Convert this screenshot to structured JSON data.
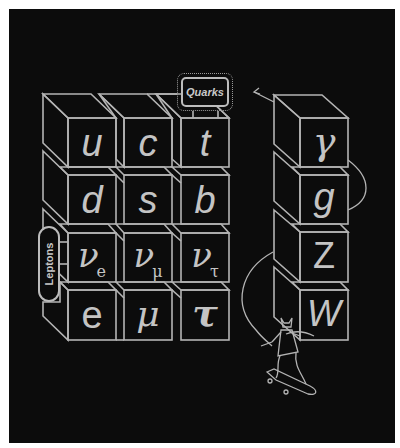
{
  "diagram": {
    "colors": {
      "background": "#0c0c0c",
      "stroke": "#b4b4b4",
      "text": "#c4c4c4",
      "page": "#ffffff"
    },
    "labels": {
      "quarks": "Quarks",
      "leptons": "Leptons"
    },
    "fermions": {
      "rows": [
        [
          {
            "symbol": "u",
            "sub": ""
          },
          {
            "symbol": "c",
            "sub": ""
          },
          {
            "symbol": "t",
            "sub": ""
          }
        ],
        [
          {
            "symbol": "d",
            "sub": ""
          },
          {
            "symbol": "s",
            "sub": ""
          },
          {
            "symbol": "b",
            "sub": ""
          }
        ],
        [
          {
            "symbol": "ν",
            "sub": "e"
          },
          {
            "symbol": "ν",
            "sub": "μ"
          },
          {
            "symbol": "ν",
            "sub": "τ"
          }
        ],
        [
          {
            "symbol": "e",
            "sub": ""
          },
          {
            "symbol": "μ",
            "sub": ""
          },
          {
            "symbol": "τ",
            "sub": ""
          }
        ]
      ]
    },
    "bosons": [
      {
        "symbol": "γ"
      },
      {
        "symbol": "g"
      },
      {
        "symbol": "Z"
      },
      {
        "symbol": "W"
      }
    ],
    "decorations": {
      "arrow": "arrow-icon",
      "figure": "skateboarder-icon"
    }
  }
}
